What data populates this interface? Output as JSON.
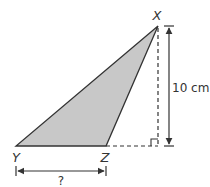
{
  "diagram": {
    "type": "triangle-height-problem",
    "vertices": {
      "X": "X",
      "Y": "Y",
      "Z": "Z"
    },
    "height_label": "10 cm",
    "base_label": "?",
    "colors": {
      "fill": "#c8c8c8",
      "stroke": "#333333",
      "arrow": "#333333"
    }
  }
}
